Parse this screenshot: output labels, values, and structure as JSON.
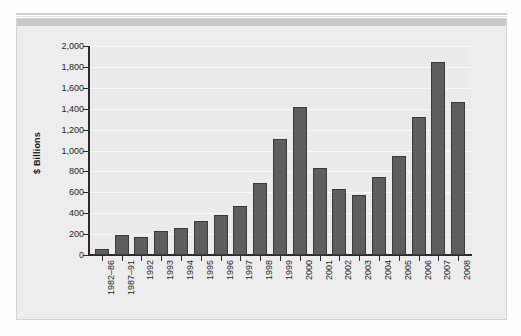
{
  "chart_data": {
    "type": "bar",
    "title": "",
    "xlabel": "",
    "ylabel": "$ Billions",
    "ylim": [
      0,
      2000
    ],
    "ytick_step": 200,
    "grid": true,
    "legend": null,
    "bar_color": "#5e5e5e",
    "plot_background": "#ebebeb",
    "categories": [
      "1982–86",
      "1987–91",
      "1992",
      "1993",
      "1994",
      "1995",
      "1996",
      "1997",
      "1998",
      "1999",
      "2000",
      "2001",
      "2002",
      "2003",
      "2004",
      "2005",
      "2006",
      "2007",
      "2008"
    ],
    "values": [
      60,
      195,
      175,
      230,
      255,
      330,
      380,
      470,
      685,
      1110,
      1415,
      835,
      630,
      570,
      745,
      950,
      1320,
      1850,
      1460
    ],
    "ytick_labels": [
      "0",
      "200",
      "400",
      "600",
      "800",
      "1,000",
      "1,200",
      "1,400",
      "1,600",
      "1,800",
      "2,000"
    ],
    "ytick_values": [
      0,
      200,
      400,
      600,
      800,
      1000,
      1200,
      1400,
      1600,
      1800,
      2000
    ]
  }
}
